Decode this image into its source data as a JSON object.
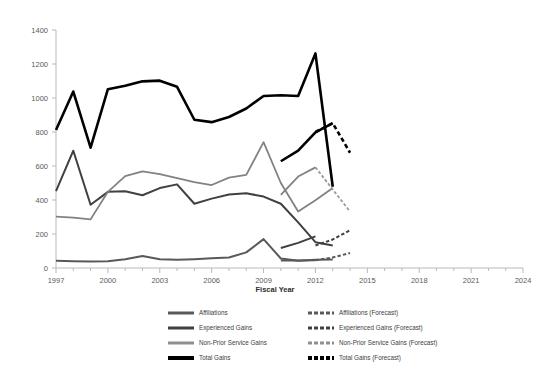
{
  "chart_data": {
    "type": "line",
    "title": "",
    "xlabel": "Fiscal Year",
    "ylabel": "",
    "xlim": [
      1997,
      2024
    ],
    "ylim": [
      0,
      1400
    ],
    "ytick_step": 200,
    "xtick_step": 1,
    "xtick_label_step": 3,
    "grid": false,
    "legend_position": "bottom",
    "xticks": [
      1997,
      2000,
      2003,
      2006,
      2009,
      2012,
      2015,
      2018,
      2021,
      2024
    ],
    "yticks": [
      0,
      200,
      400,
      600,
      800,
      1000,
      1200,
      1400
    ],
    "x": [
      1997,
      1998,
      1999,
      2000,
      2001,
      2002,
      2003,
      2004,
      2005,
      2006,
      2007,
      2008,
      2009,
      2010,
      2011,
      2012,
      2013
    ],
    "series": [
      {
        "name": "Affiliations",
        "color": "#595959",
        "style": "solid",
        "width": 2.0,
        "values": [
          42,
          40,
          38,
          40,
          52,
          70,
          52,
          48,
          52,
          58,
          62,
          92,
          170,
          56,
          42,
          48,
          50
        ]
      },
      {
        "name": "Experienced Gains",
        "color": "#404040",
        "style": "solid",
        "width": 2.0,
        "values": [
          452,
          690,
          372,
          448,
          452,
          428,
          470,
          492,
          378,
          408,
          432,
          440,
          420,
          378,
          268,
          152,
          132
        ]
      },
      {
        "name": "Non-Prior Service Gains",
        "color": "#828282",
        "style": "solid",
        "width": 1.8,
        "values": [
          302,
          296,
          286,
          448,
          540,
          568,
          552,
          528,
          505,
          488,
          532,
          548,
          740,
          500,
          332,
          398,
          470
        ]
      },
      {
        "name": "Total Gains",
        "color": "#000000",
        "style": "solid",
        "width": 2.6,
        "values": [
          812,
          1038,
          708,
          1052,
          1072,
          1098,
          1102,
          1066,
          872,
          858,
          888,
          938,
          1012,
          1016,
          1012,
          1262,
          478
        ]
      }
    ],
    "forecast_x": [
      2012,
      2013,
      2014
    ],
    "forecast_series": [
      {
        "name": "Affiliations (Forecast)",
        "color": "#595959",
        "style": "dashed",
        "width": 2.0,
        "values": [
          46,
          62,
          88
        ]
      },
      {
        "name": "Experienced Gains (Forecast)",
        "color": "#404040",
        "style": "dashed",
        "width": 2.0,
        "values": [
          132,
          168,
          222
        ]
      },
      {
        "name": "Non-Prior Service Gains (Forecast)",
        "color": "#9a9a9a",
        "style": "dashed",
        "width": 1.8,
        "values": [
          592,
          462,
          332
        ]
      },
      {
        "name": "Total Gains (Forecast)",
        "color": "#000000",
        "style": "dashed",
        "width": 2.6,
        "values": [
          800,
          852,
          678
        ]
      }
    ],
    "solid_tail_x": [
      2011,
      2012,
      2013
    ],
    "solid_tail_note": "late solid segments rise toward 2013",
    "late_solid": [
      {
        "name": "Total Gains",
        "x": [
          2010,
          2011,
          2012,
          2013
        ],
        "values": [
          628,
          690,
          798,
          852
        ]
      },
      {
        "name": "Non-Prior Service Gains",
        "x": [
          2010,
          2011,
          2012
        ],
        "values": [
          430,
          538,
          592
        ]
      },
      {
        "name": "Experienced Gains",
        "x": [
          2010,
          2011,
          2012
        ],
        "values": [
          118,
          148,
          186
        ]
      },
      {
        "name": "Affiliations",
        "x": [
          2010,
          2011,
          2012
        ],
        "values": [
          44,
          44,
          46
        ]
      }
    ]
  },
  "axis": {
    "x_title": "Fiscal Year",
    "y_labels": [
      "0",
      "200",
      "400",
      "600",
      "800",
      "1000",
      "1200",
      "1400"
    ],
    "x_labels": [
      "1997",
      "2000",
      "2003",
      "2006",
      "2009",
      "2012",
      "2015",
      "2018",
      "2021",
      "2024"
    ]
  },
  "legend": {
    "left_column": [
      {
        "label": "Affiliations",
        "color": "#595959",
        "style": "solid",
        "thickness": 3
      },
      {
        "label": "Experienced Gains",
        "color": "#404040",
        "style": "solid",
        "thickness": 3
      },
      {
        "label": "Non-Prior Service Gains",
        "color": "#8f8f8f",
        "style": "solid",
        "thickness": 3
      },
      {
        "label": "Total Gains",
        "color": "#000000",
        "style": "solid",
        "thickness": 4
      }
    ],
    "right_column": [
      {
        "label": "Affiliations (Forecast)",
        "color": "#595959",
        "style": "dashed",
        "thickness": 3
      },
      {
        "label": "Experienced Gains (Forecast)",
        "color": "#404040",
        "style": "dashed",
        "thickness": 3
      },
      {
        "label": "Non-Prior Service Gains (Forecast)",
        "color": "#8f8f8f",
        "style": "dashed",
        "thickness": 3
      },
      {
        "label": "Total Gains (Forecast)",
        "color": "#000000",
        "style": "dashed",
        "thickness": 4
      }
    ]
  }
}
